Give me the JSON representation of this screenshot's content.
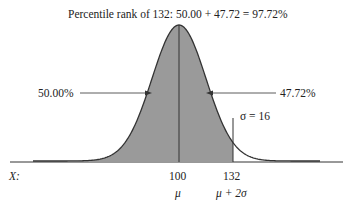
{
  "title": "Percentile rank of 132: 50.00 + 47.72 = 97.72%",
  "left_area_label": "50.00%",
  "right_area_label": "47.72%",
  "sigma_label": "σ = 16",
  "axis_label": "X:",
  "ticks": [
    {
      "value": "100",
      "symbol": "μ"
    },
    {
      "value": "132",
      "symbol": "μ + 2σ"
    }
  ],
  "colors": {
    "shade": "#9a9a9a",
    "curve": "#333333",
    "background": "#ffffff"
  }
}
